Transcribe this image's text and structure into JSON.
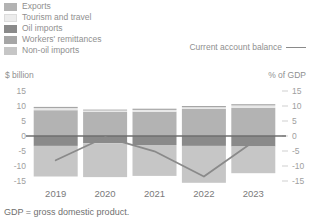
{
  "legend": {
    "items": [
      {
        "label": "Exports",
        "color": "#b3b3b3",
        "swatch_name": "legend-swatch-exports"
      },
      {
        "label": "Tourism and travel",
        "color": "#e8e8e8",
        "swatch_name": "legend-swatch-tourism-and-travel"
      },
      {
        "label": "Oil imports",
        "color": "#8a8a8a",
        "swatch_name": "legend-swatch-oil-imports"
      },
      {
        "label": "Workers' remittances",
        "color": "#a6a6a6",
        "swatch_name": "legend-swatch-workers-remittances"
      },
      {
        "label": "Non-oil imports",
        "color": "#c6c6c6",
        "swatch_name": "legend-swatch-non-oil-imports"
      }
    ],
    "line_series_label": "Current account balance",
    "line_color": "#8a8a8a"
  },
  "axes": {
    "left_title": "$ billion",
    "right_title": "% of GDP",
    "ticks": [
      "15",
      "10",
      "5",
      "0",
      "-5",
      "-10",
      "-15"
    ],
    "tick_values": [
      15,
      10,
      5,
      0,
      -5,
      -10,
      -15
    ],
    "ylim": [
      -15,
      15
    ]
  },
  "footnote": "GDP = gross domestic product.",
  "chart_data": {
    "type": "bar",
    "subtype": "stacked-bar-with-line-overlay",
    "title": "",
    "xlabel": "",
    "ylabel": "$ billion",
    "ylabel_right": "% of GDP",
    "ylim": [
      -15,
      15
    ],
    "grid": false,
    "legend_position": "top-left",
    "categories": [
      "2019",
      "2020",
      "2021",
      "2022",
      "2023"
    ],
    "series": [
      {
        "name": "Exports",
        "color": "#b3b3b3",
        "values": [
          8.6,
          8.0,
          8.1,
          9.0,
          9.4
        ]
      },
      {
        "name": "Tourism and travel",
        "color": "#e8e8e8",
        "values": [
          0.7,
          0.5,
          0.6,
          0.6,
          0.8
        ]
      },
      {
        "name": "Workers' remittances",
        "color": "#a6a6a6",
        "values": [
          0.4,
          0.3,
          0.4,
          0.4,
          0.4
        ]
      },
      {
        "name": "Oil imports",
        "color": "#8a8a8a",
        "values": [
          -3.3,
          -2.4,
          -3.0,
          -3.3,
          -3.5
        ]
      },
      {
        "name": "Non-oil imports",
        "color": "#c6c6c6",
        "values": [
          -10.2,
          -11.3,
          -10.3,
          -12.3,
          -8.9
        ]
      }
    ],
    "overlay_line": {
      "name": "Current account balance",
      "color": "#8a8a8a",
      "axis": "right",
      "unit": "% of GDP",
      "x": [
        "2019",
        "2020",
        "2021",
        "2022",
        "2023"
      ],
      "values": [
        -8.1,
        -0.4,
        -5.1,
        -13.5,
        -1.9
      ]
    }
  }
}
